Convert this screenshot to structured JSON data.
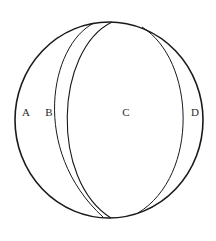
{
  "diagram": {
    "type": "sphere-sections",
    "stroke_color": "#1a1a1a",
    "background_color": "#ffffff",
    "outer_circle": {
      "cx": 109,
      "cy": 120,
      "rx": 94,
      "ry": 98
    },
    "regions": [
      {
        "id": "A",
        "label": "A",
        "x": 26,
        "y": 116
      },
      {
        "id": "B",
        "label": "B",
        "x": 49,
        "y": 116
      },
      {
        "id": "C",
        "label": "C",
        "x": 126,
        "y": 116
      },
      {
        "id": "D",
        "label": "D",
        "x": 195,
        "y": 116
      }
    ]
  }
}
